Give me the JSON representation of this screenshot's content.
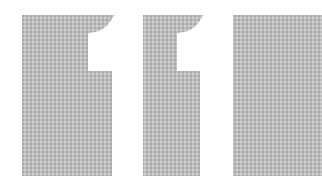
{
  "graphic": {
    "text": "11",
    "panel_color": "#bdbdbd",
    "digit_color": "#ffffff",
    "background_color": "#ffffff"
  }
}
